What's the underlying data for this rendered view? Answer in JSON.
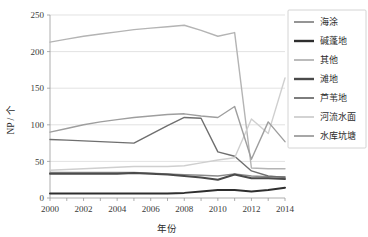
{
  "chart_data": {
    "type": "line",
    "title": "",
    "xlabel": "年份",
    "ylabel": "NP / 个",
    "x": [
      2000,
      2001,
      2002,
      2003,
      2004,
      2005,
      2006,
      2007,
      2008,
      2009,
      2010,
      2011,
      2012,
      2013,
      2014
    ],
    "xlim": [
      2000,
      2014
    ],
    "ylim": [
      0,
      250
    ],
    "yticks": [
      0,
      50,
      100,
      150,
      200,
      250
    ],
    "xticks": [
      2000,
      2002,
      2004,
      2006,
      2008,
      2010,
      2012,
      2014
    ],
    "grid": "horizontal",
    "legend_position": "right",
    "series": [
      {
        "name": "海涂",
        "color": "#8a8a8a",
        "width": 1.4,
        "values": [
          35,
          35,
          35,
          35,
          35,
          35,
          34,
          33,
          32,
          31,
          30,
          33,
          30,
          29,
          29
        ]
      },
      {
        "name": "碱蓬地",
        "color": "#2e2e2e",
        "width": 2.0,
        "values": [
          6,
          6,
          6,
          6,
          6,
          6,
          6,
          6,
          7,
          9,
          11,
          11,
          9,
          11,
          14
        ]
      },
      {
        "name": "其他",
        "color": "#b4b4b4",
        "width": 1.4,
        "values": [
          213,
          217,
          221,
          224,
          227,
          230,
          232,
          234,
          236,
          229,
          221,
          226,
          41,
          40,
          40
        ]
      },
      {
        "name": "滩地",
        "color": "#4a4a4a",
        "width": 2.0,
        "values": [
          33,
          33,
          33,
          33,
          33,
          34,
          33,
          32,
          30,
          28,
          25,
          32,
          27,
          27,
          26
        ]
      },
      {
        "name": "芦苇地",
        "color": "#6f6f6f",
        "width": 1.4,
        "values": [
          80,
          79,
          78,
          77,
          76,
          75,
          87,
          99,
          110,
          109,
          63,
          57,
          37,
          30,
          28
        ]
      },
      {
        "name": "河流水面",
        "color": "#cfcfcf",
        "width": 1.4,
        "values": [
          38,
          39,
          40,
          41,
          42,
          43,
          43,
          43,
          44,
          48,
          52,
          55,
          108,
          88,
          164
        ]
      },
      {
        "name": "水库坑塘",
        "color": "#9e9e9e",
        "width": 1.4,
        "values": [
          90,
          95,
          100,
          104,
          107,
          110,
          112,
          114,
          115,
          112,
          110,
          125,
          53,
          104,
          77
        ]
      }
    ]
  },
  "legend": {
    "items": [
      {
        "label": "海涂"
      },
      {
        "label": "碱蓬地"
      },
      {
        "label": "其他"
      },
      {
        "label": "滩地"
      },
      {
        "label": "芦苇地"
      },
      {
        "label": "河流水面"
      },
      {
        "label": "水库坑塘"
      }
    ]
  },
  "axes": {
    "y_tick_labels": [
      "250",
      "200",
      "150",
      "100",
      "50",
      "0"
    ],
    "x_tick_labels": [
      "2000",
      "2002",
      "2004",
      "2006",
      "2008",
      "2010",
      "2012",
      "2014"
    ],
    "y_title": "NP / 个",
    "x_title": "年份"
  }
}
